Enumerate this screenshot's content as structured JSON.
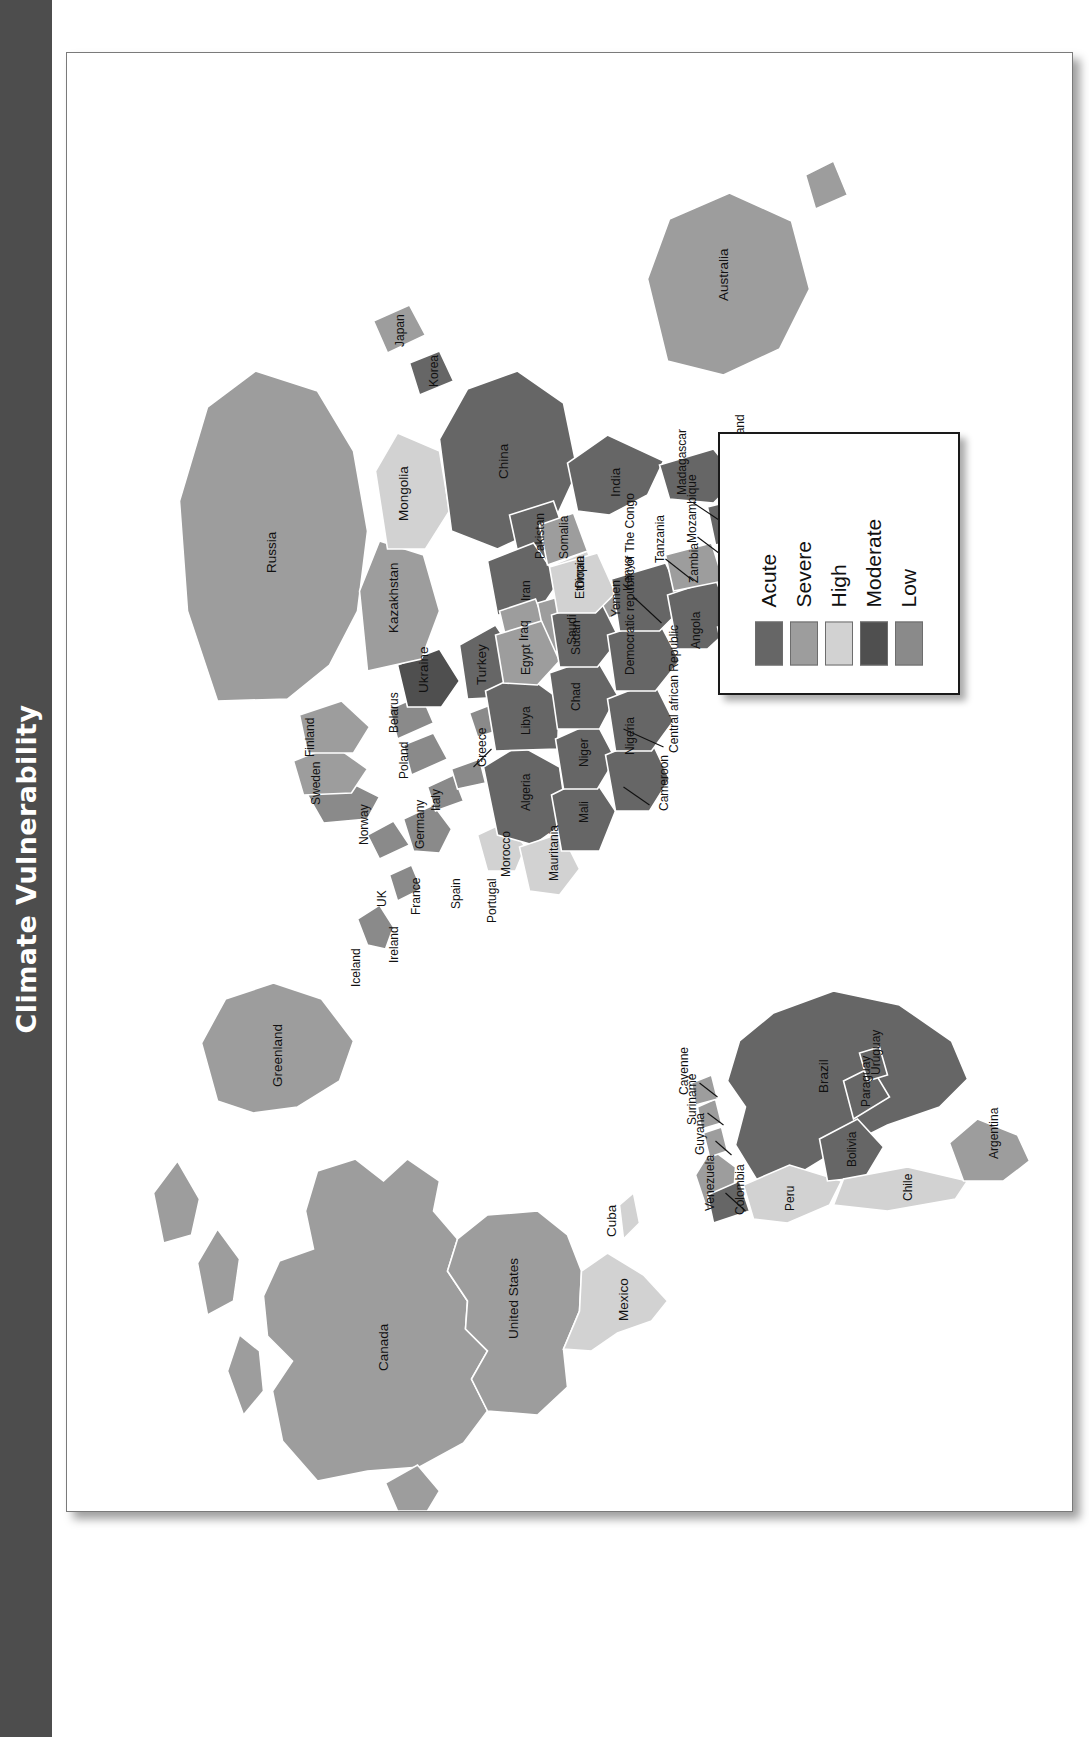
{
  "page": {
    "title": "Climate Vulnerability",
    "band_color": "#4d4d4d",
    "panel_background": "#ffffff"
  },
  "legend": {
    "name": "map-legend",
    "items": [
      {
        "label": "Acute",
        "color": "#666666"
      },
      {
        "label": "Severe",
        "color": "#9d9d9d"
      },
      {
        "label": "High",
        "color": "#d2d2d2"
      },
      {
        "label": "Moderate",
        "color": "#4f4f4f"
      },
      {
        "label": "Low",
        "color": "#8a8a8a"
      }
    ]
  },
  "map": {
    "name": "world-climate-vulnerability-map",
    "projection_note": "world map, rotated 90 degrees counter-clockwise on the page",
    "palette": {
      "acute": "#666666",
      "severe": "#9d9d9d",
      "high": "#d2d2d2",
      "moderate": "#4f4f4f",
      "low": "#8a8a8a",
      "ocean": "#ffffff",
      "border": "#ffffff"
    },
    "labels": [
      "Canada",
      "United States",
      "Mexico",
      "Cuba",
      "Greenland",
      "Iceland",
      "Ireland",
      "UK",
      "Norway",
      "Sweden",
      "Finland",
      "France",
      "Spain",
      "Portugal",
      "Germany",
      "Italy",
      "Poland",
      "Belarus",
      "Ukraine",
      "Greece",
      "Turkey",
      "Russia",
      "Kazakhstan",
      "Mongolia",
      "China",
      "Korea",
      "Japan",
      "India",
      "Pakistan",
      "Iran",
      "Iraq",
      "Saudi",
      "Oman",
      "Yemen",
      "Egypt",
      "Libya",
      "Algeria",
      "Morocco",
      "Mauritania",
      "Mali",
      "Niger",
      "Nigeria",
      "Chad",
      "Sudan",
      "Ethiopia",
      "Somalia",
      "Cameroon",
      "Central african Republic",
      "Democratic republic of The Congo",
      "Kenya",
      "Tanzania",
      "Mozambique",
      "Madagascar",
      "Zimbabwe",
      "Zambia",
      "Angola",
      "Namibia",
      "Botswana",
      "Swaziland",
      "Lesotho",
      "Australia",
      "Colombia",
      "Venezuela",
      "Guyana",
      "Suriname",
      "Cayenne",
      "Brazil",
      "Peru",
      "Bolivia",
      "Chile",
      "Paraguay",
      "Uruguay",
      "Argentina"
    ],
    "country_levels": {
      "Canada": "severe",
      "United States": "severe",
      "Mexico": "high",
      "Cuba": "high",
      "Greenland": "severe",
      "Iceland": "low",
      "Ireland": "low",
      "UK": "low",
      "Norway": "low",
      "Sweden": "severe",
      "Finland": "severe",
      "France": "low",
      "Spain": "low",
      "Portugal": "high",
      "Germany": "low",
      "Italy": "low",
      "Poland": "low",
      "Belarus": "low",
      "Ukraine": "moderate",
      "Greece": "low",
      "Turkey": "acute",
      "Russia": "severe",
      "Kazakhstan": "severe",
      "Mongolia": "high",
      "China": "acute",
      "Korea": "acute",
      "Japan": "severe",
      "India": "acute",
      "Pakistan": "acute",
      "Iran": "acute",
      "Iraq": "severe",
      "Saudi": "severe",
      "Oman": "high",
      "Yemen": "severe",
      "Egypt": "severe",
      "Libya": "acute",
      "Algeria": "acute",
      "Morocco": "high",
      "Mauritania": "high",
      "Mali": "acute",
      "Niger": "acute",
      "Nigeria": "acute",
      "Chad": "acute",
      "Sudan": "acute",
      "Ethiopia": "high",
      "Somalia": "severe",
      "Cameroon": "acute",
      "Central african Republic": "acute",
      "Democratic republic of The Congo": "acute",
      "Kenya": "acute",
      "Tanzania": "acute",
      "Mozambique": "acute",
      "Madagascar": "acute",
      "Zimbabwe": "acute",
      "Zambia": "severe",
      "Angola": "acute",
      "Namibia": "acute",
      "Botswana": "acute",
      "Swaziland": "acute",
      "Lesotho": "acute",
      "Australia": "severe",
      "Colombia": "acute",
      "Venezuela": "severe",
      "Guyana": "severe",
      "Suriname": "severe",
      "Cayenne": "severe",
      "Brazil": "acute",
      "Peru": "high",
      "Bolivia": "acute",
      "Chile": "high",
      "Paraguay": "acute",
      "Uruguay": "acute",
      "Argentina": "severe"
    }
  }
}
